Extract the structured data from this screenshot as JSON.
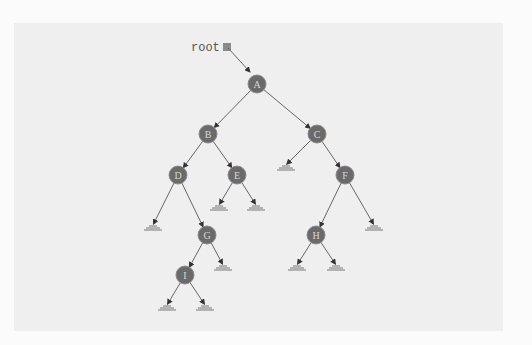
{
  "diagram": {
    "type": "binary-tree",
    "root_pointer": {
      "label": "root",
      "x": 227,
      "y": 47
    },
    "colors": {
      "node_fill": "#6a6a6a",
      "node_stroke": "#8a8a8a",
      "node_text": "#d8d8d8",
      "edge": "#666666",
      "panel_bg": "#efefef",
      "page_bg": "#fbfbfb"
    },
    "nodes": [
      {
        "id": "A",
        "label": "A",
        "x": 257,
        "y": 84
      },
      {
        "id": "B",
        "label": "B",
        "x": 208,
        "y": 134
      },
      {
        "id": "C",
        "label": "C",
        "x": 317,
        "y": 134
      },
      {
        "id": "D",
        "label": "D",
        "x": 178,
        "y": 175
      },
      {
        "id": "E",
        "label": "E",
        "x": 237,
        "y": 175
      },
      {
        "id": "F",
        "label": "F",
        "x": 345,
        "y": 175
      },
      {
        "id": "G",
        "label": "G",
        "x": 207,
        "y": 235
      },
      {
        "id": "H",
        "label": "H",
        "x": 316,
        "y": 235
      },
      {
        "id": "I",
        "label": "I",
        "x": 185,
        "y": 275
      }
    ],
    "edges": [
      {
        "from": "A",
        "to": "B"
      },
      {
        "from": "A",
        "to": "C"
      },
      {
        "from": "B",
        "to": "D"
      },
      {
        "from": "B",
        "to": "E"
      },
      {
        "from": "C",
        "to": "null_C_left"
      },
      {
        "from": "C",
        "to": "F"
      },
      {
        "from": "D",
        "to": "null_D_left"
      },
      {
        "from": "D",
        "to": "G"
      },
      {
        "from": "E",
        "to": "null_E_left"
      },
      {
        "from": "E",
        "to": "null_E_right"
      },
      {
        "from": "F",
        "to": "H"
      },
      {
        "from": "F",
        "to": "null_F_right"
      },
      {
        "from": "G",
        "to": "I"
      },
      {
        "from": "G",
        "to": "null_G_right"
      },
      {
        "from": "H",
        "to": "null_H_left"
      },
      {
        "from": "H",
        "to": "null_H_right"
      },
      {
        "from": "I",
        "to": "null_I_left"
      },
      {
        "from": "I",
        "to": "null_I_right"
      }
    ],
    "nulls": [
      {
        "id": "null_C_left",
        "x": 286,
        "y": 165
      },
      {
        "id": "null_D_left",
        "x": 153,
        "y": 225
      },
      {
        "id": "null_E_left",
        "x": 219,
        "y": 205
      },
      {
        "id": "null_E_right",
        "x": 256,
        "y": 205
      },
      {
        "id": "null_F_right",
        "x": 374,
        "y": 225
      },
      {
        "id": "null_G_right",
        "x": 223,
        "y": 265
      },
      {
        "id": "null_H_left",
        "x": 297,
        "y": 265
      },
      {
        "id": "null_H_right",
        "x": 336,
        "y": 265
      },
      {
        "id": "null_I_left",
        "x": 167,
        "y": 305
      },
      {
        "id": "null_I_right",
        "x": 205,
        "y": 305
      }
    ]
  }
}
